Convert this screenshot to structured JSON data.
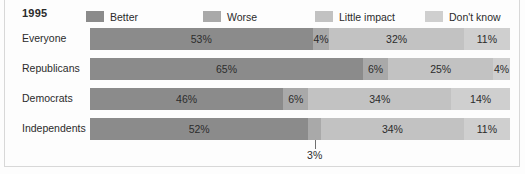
{
  "header": {
    "year": "1995"
  },
  "legend": {
    "position": "top",
    "items": [
      {
        "label": "Better",
        "color": "#8b8b8b",
        "x": 86
      },
      {
        "label": "Worse",
        "color": "#a9a9a9",
        "x": 203
      },
      {
        "label": "Little impact",
        "color": "#c2c2c2",
        "x": 315
      },
      {
        "label": "Don't know",
        "color": "#cfcfcf",
        "x": 425
      }
    ]
  },
  "chart_data": {
    "type": "bar",
    "orientation": "horizontal",
    "stacked": true,
    "stack_total": 100,
    "title": "1995",
    "xlabel": "",
    "ylabel": "",
    "xlim": [
      0,
      100
    ],
    "grid": false,
    "legend_position": "top",
    "categories": [
      "Everyone",
      "Republicans",
      "Democrats",
      "Independents"
    ],
    "series": [
      {
        "name": "Better",
        "color": "#8b8b8b",
        "values": [
          53,
          65,
          46,
          52
        ]
      },
      {
        "name": "Worse",
        "color": "#a9a9a9",
        "values": [
          4,
          6,
          6,
          3
        ]
      },
      {
        "name": "Little impact",
        "color": "#c2c2c2",
        "values": [
          32,
          25,
          34,
          34
        ]
      },
      {
        "name": "Don't know",
        "color": "#cfcfcf",
        "values": [
          11,
          4,
          14,
          11
        ]
      }
    ],
    "annotations": [
      {
        "text": "3%",
        "for_row": "Independents",
        "for_series": "Worse",
        "placement": "below-bar-leader-line"
      }
    ]
  },
  "rows": [
    {
      "label": "Everyone",
      "segments": [
        {
          "name": "Better",
          "value": 53,
          "value_label": "53%",
          "color": "#8b8b8b",
          "inline": true
        },
        {
          "name": "Worse",
          "value": 4,
          "value_label": "4%",
          "color": "#a9a9a9",
          "inline": true
        },
        {
          "name": "Little impact",
          "value": 32,
          "value_label": "32%",
          "color": "#c2c2c2",
          "inline": true
        },
        {
          "name": "Don't know",
          "value": 11,
          "value_label": "11%",
          "color": "#cfcfcf",
          "inline": true
        }
      ]
    },
    {
      "label": "Republicans",
      "segments": [
        {
          "name": "Better",
          "value": 65,
          "value_label": "65%",
          "color": "#8b8b8b",
          "inline": true
        },
        {
          "name": "Worse",
          "value": 6,
          "value_label": "6%",
          "color": "#a9a9a9",
          "inline": true
        },
        {
          "name": "Little impact",
          "value": 25,
          "value_label": "25%",
          "color": "#c2c2c2",
          "inline": true
        },
        {
          "name": "Don't know",
          "value": 4,
          "value_label": "4%",
          "color": "#cfcfcf",
          "inline": true
        }
      ]
    },
    {
      "label": "Democrats",
      "segments": [
        {
          "name": "Better",
          "value": 46,
          "value_label": "46%",
          "color": "#8b8b8b",
          "inline": true
        },
        {
          "name": "Worse",
          "value": 6,
          "value_label": "6%",
          "color": "#a9a9a9",
          "inline": true
        },
        {
          "name": "Little impact",
          "value": 34,
          "value_label": "34%",
          "color": "#c2c2c2",
          "inline": true
        },
        {
          "name": "Don't know",
          "value": 14,
          "value_label": "14%",
          "color": "#cfcfcf",
          "inline": true
        }
      ]
    },
    {
      "label": "Independents",
      "segments": [
        {
          "name": "Better",
          "value": 52,
          "value_label": "52%",
          "color": "#8b8b8b",
          "inline": true
        },
        {
          "name": "Worse",
          "value": 3,
          "value_label": "3%",
          "color": "#a9a9a9",
          "inline": false
        },
        {
          "name": "Little impact",
          "value": 34,
          "value_label": "34%",
          "color": "#c2c2c2",
          "inline": true
        },
        {
          "name": "Don't know",
          "value": 11,
          "value_label": "11%",
          "color": "#cfcfcf",
          "inline": true
        }
      ]
    }
  ],
  "callout": {
    "text": "3%"
  }
}
